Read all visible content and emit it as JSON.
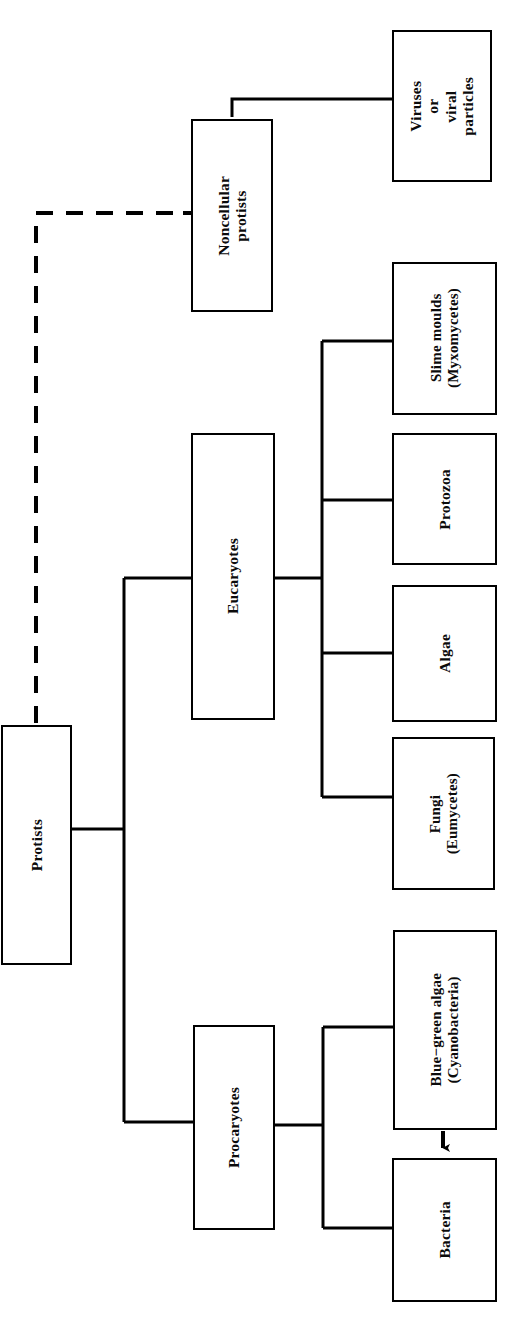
{
  "diagram": {
    "orientation": "rotated-90-ccw",
    "line_color": "#000000",
    "background_color": "#ffffff",
    "nodes": [
      {
        "id": "protists",
        "label": "Protists",
        "x": 1,
        "y": 725,
        "w": 71,
        "h": 240,
        "level": 0
      },
      {
        "id": "noncellular-protists",
        "label": "Noncellular\nprotists",
        "x": 191,
        "y": 119,
        "w": 82,
        "h": 193,
        "level": 1
      },
      {
        "id": "eucaryotes",
        "label": "Eucaryotes",
        "x": 191,
        "y": 433,
        "w": 84,
        "h": 287,
        "level": 1
      },
      {
        "id": "procaryotes",
        "label": "Procaryotes",
        "x": 193,
        "y": 1025,
        "w": 82,
        "h": 205,
        "level": 1
      },
      {
        "id": "viruses",
        "label": "Viruses\nor\nviral\nparticles",
        "x": 392,
        "y": 30,
        "w": 100,
        "h": 152,
        "level": 2
      },
      {
        "id": "slime-moulds",
        "label": "Slime moulds\n(Myxomycetes)",
        "x": 392,
        "y": 262,
        "w": 105,
        "h": 153,
        "level": 2
      },
      {
        "id": "protozoa",
        "label": "Protozoa",
        "x": 392,
        "y": 433,
        "w": 105,
        "h": 132,
        "level": 2
      },
      {
        "id": "algae",
        "label": "Algae",
        "x": 392,
        "y": 585,
        "w": 105,
        "h": 137,
        "level": 2
      },
      {
        "id": "fungi",
        "label": "Fungi\n(Eumycetes)",
        "x": 392,
        "y": 737,
        "w": 103,
        "h": 153,
        "level": 2
      },
      {
        "id": "blue-green-algae",
        "label": "Blue−green algae\n(Cyanobacteria)",
        "x": 393,
        "y": 930,
        "w": 104,
        "h": 200,
        "level": 2
      },
      {
        "id": "bacteria",
        "label": "Bacteria",
        "x": 392,
        "y": 1158,
        "w": 105,
        "h": 144,
        "level": 2
      }
    ],
    "edges": [
      {
        "id": "protists-to-noncellular",
        "from": "protists",
        "to": "noncellular-protists",
        "style": "dashed"
      },
      {
        "id": "protists-to-eucaryotes",
        "from": "protists",
        "to": "eucaryotes",
        "style": "solid"
      },
      {
        "id": "protists-to-procaryotes",
        "from": "protists",
        "to": "procaryotes",
        "style": "solid"
      },
      {
        "id": "noncellular-to-viruses",
        "from": "noncellular-protists",
        "to": "viruses",
        "style": "solid"
      },
      {
        "id": "eucaryotes-to-slime-moulds",
        "from": "eucaryotes",
        "to": "slime-moulds",
        "style": "solid"
      },
      {
        "id": "eucaryotes-to-protozoa",
        "from": "eucaryotes",
        "to": "protozoa",
        "style": "solid"
      },
      {
        "id": "eucaryotes-to-algae",
        "from": "eucaryotes",
        "to": "algae",
        "style": "solid"
      },
      {
        "id": "eucaryotes-to-fungi",
        "from": "eucaryotes",
        "to": "fungi",
        "style": "solid"
      },
      {
        "id": "procaryotes-to-blue-green-algae",
        "from": "procaryotes",
        "to": "blue-green-algae",
        "style": "solid"
      },
      {
        "id": "procaryotes-to-bacteria",
        "from": "procaryotes",
        "to": "bacteria",
        "style": "solid"
      },
      {
        "id": "blue-green-algae-to-bacteria-arrow",
        "from": "blue-green-algae",
        "to": "bacteria",
        "style": "arrow"
      }
    ]
  }
}
